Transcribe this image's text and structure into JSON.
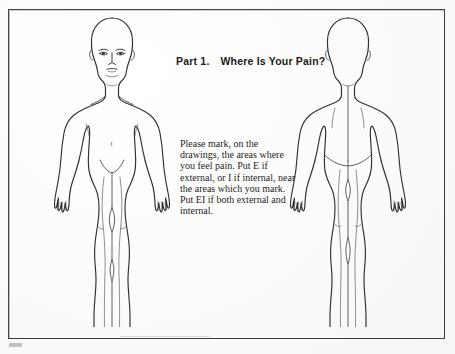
{
  "form": {
    "title_part": "Part 1.",
    "title_question": "Where Is Your Pain?",
    "instructions": "Please mark, on the drawings, the areas where you feel pain. Put E if external, or I if internal, near the areas which you mark. Put EI if both external and internal.",
    "border_color": "#3a3a3a",
    "ink_color": "#2e2e2e",
    "paper_color": "#fdfdfc"
  },
  "figures": [
    {
      "name": "front-view-body-diagram",
      "view": "front"
    },
    {
      "name": "back-view-body-diagram",
      "view": "back"
    }
  ]
}
